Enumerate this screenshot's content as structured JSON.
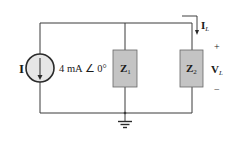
{
  "diagram": {
    "type": "circuit",
    "source": {
      "symbol": "I",
      "value": "4 mA ∠ 0°",
      "kind": "current-source"
    },
    "impedances": [
      {
        "symbol": "Z",
        "subscript": "1"
      },
      {
        "symbol": "Z",
        "subscript": "2"
      }
    ],
    "load_current": {
      "symbol": "I",
      "subscript": "L"
    },
    "load_voltage": {
      "symbol": "V",
      "subscript": "L",
      "plus": "+",
      "minus": "−"
    },
    "colors": {
      "wire": "#3a3a3a",
      "impedance_fill": "#c4c4c4",
      "source_fill": "#e6e6e6",
      "text": "#1a1a1a"
    }
  }
}
